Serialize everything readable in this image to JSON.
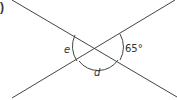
{
  "part_label": ")",
  "diagram": {
    "type": "intersecting-lines",
    "lines": 2,
    "angles": {
      "e": "e",
      "d": "d",
      "given": "65°"
    },
    "colors": {
      "stroke": "#444444",
      "text": "#333333",
      "background": "#ffffff"
    }
  }
}
